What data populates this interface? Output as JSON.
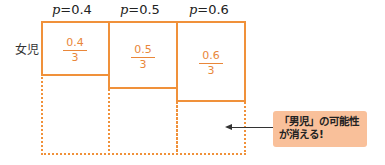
{
  "columns": [
    {
      "p_label": "p",
      "p_eq": "=0.4",
      "numerator": "0.4",
      "denominator": "3"
    },
    {
      "p_label": "p",
      "p_eq": "=0.5",
      "numerator": "0.5",
      "denominator": "3"
    },
    {
      "p_label": "p",
      "p_eq": "=0.6",
      "numerator": "0.6",
      "denominator": "3"
    }
  ],
  "row_label": "女児",
  "callout": {
    "text": "「男児」の可能性が消える!"
  },
  "colors": {
    "accent": "#f0913a",
    "callout_bg": "#f9c09a",
    "text": "#222222"
  }
}
